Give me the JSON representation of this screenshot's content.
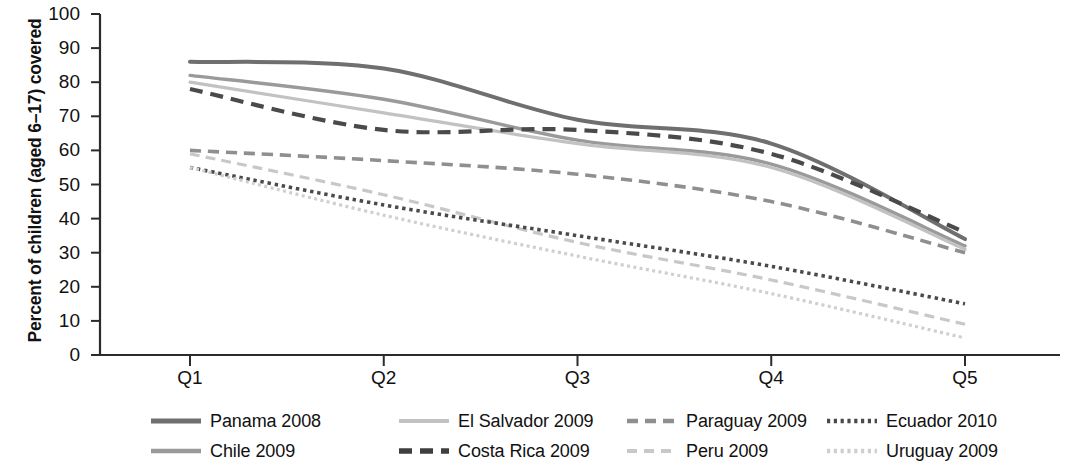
{
  "chart_data": {
    "type": "line",
    "title": "",
    "xlabel": "",
    "ylabel": "Percent of children (aged 6–17) covered",
    "categories": [
      "Q1",
      "Q2",
      "Q3",
      "Q4",
      "Q5"
    ],
    "ylim": [
      0,
      100
    ],
    "ytick_step": 10,
    "yticks": [
      100,
      90,
      80,
      70,
      60,
      50,
      40,
      30,
      20,
      10,
      0
    ],
    "grid": false,
    "legend_position": "bottom",
    "series": [
      {
        "name": "Panama 2008",
        "values": [
          86,
          84,
          69,
          62,
          34
        ],
        "style": "solid",
        "color": "#6f6f6f",
        "width": 4
      },
      {
        "name": "Chile 2009",
        "values": [
          82,
          75,
          63,
          56,
          32
        ],
        "style": "solid",
        "color": "#9a9a9a",
        "width": 3.4
      },
      {
        "name": "El Salvador 2009",
        "values": [
          80,
          71,
          62,
          55,
          31
        ],
        "style": "solid",
        "color": "#c2c2c2",
        "width": 3.2
      },
      {
        "name": "Costa Rica 2009",
        "values": [
          78,
          66,
          66,
          59,
          36
        ],
        "style": "dashed",
        "color": "#4a4a4a",
        "width": 4.2
      },
      {
        "name": "Paraguay 2009",
        "values": [
          60,
          57,
          53,
          45,
          30
        ],
        "style": "dashed",
        "color": "#8f8f8f",
        "width": 3.6
      },
      {
        "name": "Peru 2009",
        "values": [
          59,
          47,
          33,
          22,
          9
        ],
        "style": "dashed",
        "color": "#c8c8c8",
        "width": 3.2
      },
      {
        "name": "Ecuador 2010",
        "values": [
          55,
          44,
          35,
          26,
          15
        ],
        "style": "dotted",
        "color": "#4a4a4a",
        "width": 3.6
      },
      {
        "name": "Uruguay 2009",
        "values": [
          55,
          41,
          29,
          18,
          5
        ],
        "style": "dotted",
        "color": "#cfcfcf",
        "width": 3.2
      }
    ]
  },
  "axis": {
    "y_title": "Percent of children (aged 6–17) covered",
    "y_ticks": [
      "100",
      "90",
      "80",
      "70",
      "60",
      "50",
      "40",
      "30",
      "20",
      "10",
      "0"
    ],
    "x_ticks": [
      "Q1",
      "Q2",
      "Q3",
      "Q4",
      "Q5"
    ]
  },
  "legend": {
    "items": [
      {
        "label": "Panama 2008",
        "swatch": "solid-dark-line-icon"
      },
      {
        "label": "El Salvador 2009",
        "swatch": "solid-light-line-icon"
      },
      {
        "label": "Paraguay 2009",
        "swatch": "dashed-medium-line-icon"
      },
      {
        "label": "Ecuador 2010",
        "swatch": "dotted-dark-line-icon"
      },
      {
        "label": "Chile 2009",
        "swatch": "solid-medium-line-icon"
      },
      {
        "label": "Costa Rica 2009",
        "swatch": "dashed-dark-line-icon"
      },
      {
        "label": "Peru 2009",
        "swatch": "dashed-light-line-icon"
      },
      {
        "label": "Uruguay 2009",
        "swatch": "dotted-light-line-icon"
      }
    ]
  },
  "colors": {
    "axis": "#2b2b2b",
    "text": "#111111",
    "panama": "#6f6f6f",
    "chile": "#9a9a9a",
    "el_salvador": "#c2c2c2",
    "costa_rica": "#4a4a4a",
    "paraguay": "#8f8f8f",
    "peru": "#c8c8c8",
    "ecuador": "#4a4a4a",
    "uruguay": "#cfcfcf"
  }
}
